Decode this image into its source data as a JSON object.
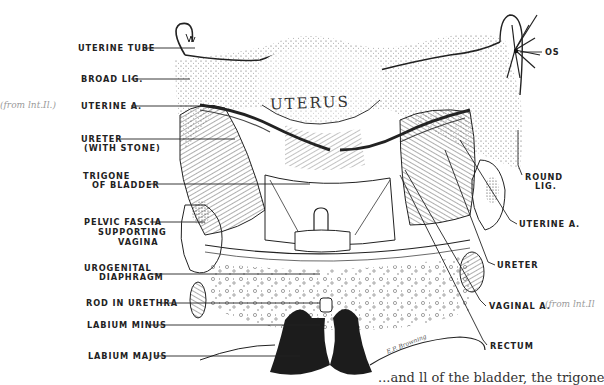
{
  "figure": {
    "type": "anatomical illustration",
    "organ_label": "UTERUS",
    "artist_signature": "E.P. Browning",
    "labels_left": [
      {
        "id": "uterine-tube",
        "text": "UTERINE TUBE"
      },
      {
        "id": "broad-lig",
        "text": "BROAD LIG."
      },
      {
        "id": "uterine-a-left",
        "text": "UTERINE A."
      },
      {
        "id": "ureter-with-stone",
        "text": "URETER",
        "text2": "(WITH STONE)"
      },
      {
        "id": "trigone",
        "text": "TRIGONE",
        "text2": "OF BLADDER"
      },
      {
        "id": "pelvic-fascia",
        "text": "PELVIC FASCIA",
        "text2": "SUPPORTING",
        "text3": "VAGINA"
      },
      {
        "id": "urogenital-diaphragm",
        "text": "UROGENITAL",
        "text2": "DIAPHRAGM"
      },
      {
        "id": "rod-in-urethra",
        "text": "ROD IN URETHRA"
      },
      {
        "id": "labium-minus",
        "text": "LABIUM MINUS"
      },
      {
        "id": "labium-majus",
        "text": "LABIUM MAJUS"
      }
    ],
    "labels_right": [
      {
        "id": "os",
        "text": "OS"
      },
      {
        "id": "round-lig",
        "text": "ROUND",
        "text2": "LIG."
      },
      {
        "id": "uterine-a-right",
        "text": "UTERINE A."
      },
      {
        "id": "ureter-right",
        "text": "URETER"
      },
      {
        "id": "vaginal-a",
        "text": "VAGINAL A."
      },
      {
        "id": "rectum",
        "text": "RECTUM"
      }
    ],
    "handwritten_notes": [
      {
        "id": "note-left",
        "text": "(from lnt.Il.)"
      },
      {
        "id": "note-right",
        "text": "(from lnt.Il"
      }
    ]
  },
  "caption_fragment": "...and ll of the bladder, the trigone"
}
